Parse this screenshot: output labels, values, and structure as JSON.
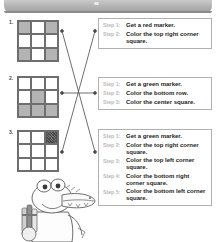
{
  "page": {
    "header": {
      "name": "header-bar"
    },
    "mascot": {
      "name": "crocodile-mascot-holding-markers"
    }
  },
  "problems": [
    {
      "number": "1.",
      "grid": {
        "rows": 3,
        "cols": 3,
        "fill_style": "shaded",
        "cells": [
          [
            "fill",
            "empty",
            "fill"
          ],
          [
            "empty",
            "empty",
            "empty"
          ],
          [
            "fill",
            "empty",
            "fill"
          ]
        ]
      }
    },
    {
      "number": "2.",
      "grid": {
        "rows": 3,
        "cols": 3,
        "fill_style": "shaded",
        "cells": [
          [
            "empty",
            "empty",
            "empty"
          ],
          [
            "empty",
            "fill",
            "empty"
          ],
          [
            "fill",
            "fill",
            "fill"
          ]
        ]
      }
    },
    {
      "number": "3.",
      "grid": {
        "rows": 3,
        "cols": 3,
        "fill_style": "scribble",
        "cells": [
          [
            "empty",
            "empty",
            "scribble"
          ],
          [
            "empty",
            "empty",
            "empty"
          ],
          [
            "empty",
            "empty",
            "empty"
          ]
        ]
      }
    }
  ],
  "instruction_boxes": [
    {
      "steps": [
        {
          "label": "Step 1:",
          "text": "Get a red marker."
        },
        {
          "label": "Step 2:",
          "text": "Color the top right corner square."
        }
      ]
    },
    {
      "steps": [
        {
          "label": "Step 1:",
          "text": "Get a green marker."
        },
        {
          "label": "Step 2:",
          "text": "Color the bottom row."
        },
        {
          "label": "Step 3:",
          "text": "Color the center square."
        }
      ]
    },
    {
      "steps": [
        {
          "label": "Step 1:",
          "text": "Get a green marker."
        },
        {
          "label": "Step 2:",
          "text": "Color the top right corner square."
        },
        {
          "label": "Step 3:",
          "text": "Color the top left corner square."
        },
        {
          "label": "Step 4:",
          "text": "Color the bottom right corner square."
        },
        {
          "label": "Step 5:",
          "text": "Color the bottom left corner square."
        }
      ]
    }
  ],
  "connections": [
    {
      "from": "grid-1",
      "to": "instruction-box-3"
    },
    {
      "from": "grid-2",
      "to": "instruction-box-2"
    },
    {
      "from": "grid-3",
      "to": "instruction-box-1"
    }
  ],
  "colors": {
    "shade": "#b4b4b4",
    "grid_line": "#6e6e6e",
    "step_label": "#b9b9b9",
    "step_text": "#1d1d1d",
    "box_border": "#b0b0b0",
    "header": "#9d9d9d"
  }
}
